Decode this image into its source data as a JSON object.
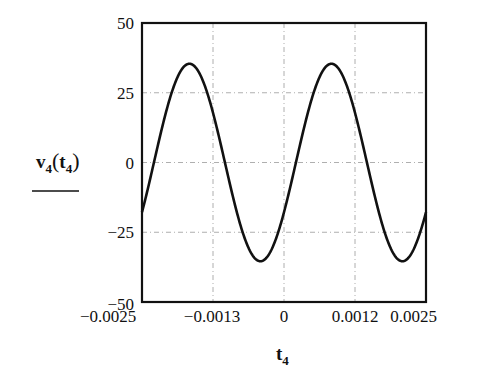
{
  "chart_data": {
    "type": "line",
    "title": "",
    "xlabel": "t4",
    "ylabel": "v4(t4)",
    "xlabel_parts": {
      "base": "t",
      "sub": "4"
    },
    "ylabel_parts": {
      "func": "v",
      "func_sub": "4",
      "arg": "t",
      "arg_sub": "4"
    },
    "xlim": [
      -0.0025,
      0.0025
    ],
    "ylim": [
      -50,
      50
    ],
    "xticks": [
      -0.0025,
      -0.00125,
      0,
      0.00125,
      0.0025
    ],
    "xtick_labels": [
      "−0.0025",
      "−0.0013",
      "0",
      "0.0012",
      "0.0025"
    ],
    "yticks": [
      50,
      25,
      0,
      -25,
      -50
    ],
    "ytick_labels": [
      "50",
      "25",
      "0",
      "−25",
      "−50"
    ],
    "grid": true,
    "legend": null,
    "series": [
      {
        "name": "v4(t4)",
        "model": "35.4*sin(2*pi*400*(t-0.00021))",
        "x": [
          -0.0025,
          -0.00225,
          -0.002,
          -0.00175,
          -0.0015,
          -0.00125,
          -0.001,
          -0.00075,
          -0.0005,
          -0.00025,
          0,
          0.00025,
          0.0005,
          0.00075,
          0.001,
          0.00125,
          0.0015,
          0.00175,
          0.002,
          0.00225,
          0.0025
        ],
        "values": [
          -20.8,
          2.1,
          23.6,
          35.0,
          31.2,
          14.0,
          -8.9,
          -28.6,
          -35.3,
          -26.2,
          -5.3,
          16.9,
          32.0,
          34.6,
          21.5,
          -0.5,
          -22.1,
          -34.6,
          -31.7,
          -15.4,
          7.5
        ]
      }
    ],
    "features": {
      "amplitude": 35.4,
      "frequency_hz": 400,
      "peaks": [
        {
          "t": -0.00159,
          "v": 35.4
        },
        {
          "t": 0.00084,
          "v": 35.4
        }
      ],
      "troughs": [
        {
          "t": -0.00034,
          "v": -35.4
        },
        {
          "t": 0.00209,
          "v": -35.4
        }
      ]
    },
    "colors": {
      "line": "#111111",
      "grid": "#9a9a9a",
      "frame": "#111111"
    }
  }
}
